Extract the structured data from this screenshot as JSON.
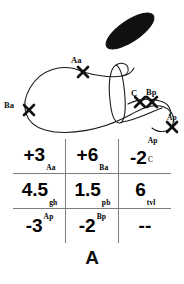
{
  "figure": {
    "caption": "A",
    "diagram": {
      "labels": [
        {
          "id": "aa",
          "text": "Aa"
        },
        {
          "id": "ba",
          "text": "Ba"
        },
        {
          "id": "c",
          "text": "C"
        },
        {
          "id": "bp",
          "text": "Bp"
        },
        {
          "id": "ap",
          "text": "Ap"
        }
      ],
      "markers": [
        {
          "id": "marker-aa",
          "x": 83,
          "y": 72
        },
        {
          "id": "marker-ba",
          "x": 29,
          "y": 110
        },
        {
          "id": "marker-c",
          "x": 140,
          "y": 102
        },
        {
          "id": "marker-bp",
          "x": 152,
          "y": 102
        },
        {
          "id": "marker-ap",
          "x": 172,
          "y": 127
        }
      ],
      "blob": {
        "id": "dark-ellipse",
        "cx": 130,
        "cy": 30,
        "rx": 27,
        "ry": 10,
        "rotation": -33,
        "color": "#101010"
      }
    },
    "table": {
      "rows": [
        [
          {
            "main": "+3",
            "sub": "Aa",
            "sup": ""
          },
          {
            "main": "+6",
            "sub": "Ba",
            "sup": ""
          },
          {
            "main": "-2",
            "sub": "C",
            "sup": "Ap"
          }
        ],
        [
          {
            "main": "4.5",
            "sub": "gh",
            "sup": ""
          },
          {
            "main": "1.5",
            "sub": "pb",
            "sup": ""
          },
          {
            "main": "6",
            "sub": "tvl",
            "sup": ""
          }
        ],
        [
          {
            "main": "-3",
            "sub": "",
            "sup": "Ap"
          },
          {
            "main": "-2",
            "sub": "",
            "sup": "Bp"
          },
          {
            "main": "--",
            "sub": "",
            "sup": ""
          }
        ]
      ]
    }
  },
  "colors": {
    "ink": "#111111",
    "rule": "#7d7d7d",
    "background": "#ffffff"
  }
}
